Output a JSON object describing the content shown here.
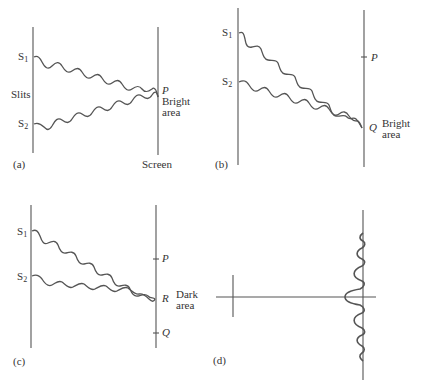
{
  "figure": {
    "panels": [
      {
        "id": "a",
        "caption": "(a)",
        "labels": {
          "s1": "S",
          "s1_sub": "1",
          "s2": "S",
          "s2_sub": "2",
          "slits": "Slits",
          "point": "P",
          "area_line1": "Bright",
          "area_line2": "area",
          "screen": "Screen"
        }
      },
      {
        "id": "b",
        "caption": "(b)",
        "labels": {
          "s1": "S",
          "s1_sub": "1",
          "s2": "S",
          "s2_sub": "2",
          "point_p": "P",
          "point_q": "Q",
          "area_line1": "Bright",
          "area_line2": "area"
        }
      },
      {
        "id": "c",
        "caption": "(c)",
        "labels": {
          "s1": "S",
          "s1_sub": "1",
          "s2": "S",
          "s2_sub": "2",
          "point_p": "P",
          "point_r": "R",
          "point_q": "Q",
          "area_line1": "Dark",
          "area_line2": "area"
        }
      },
      {
        "id": "d",
        "caption": "(d)",
        "description": "Intensity pattern on screen: central bright maximum with decreasing side fringes"
      }
    ],
    "colors": {
      "stroke": "#555555",
      "text": "#333333",
      "background": "#ffffff"
    }
  }
}
